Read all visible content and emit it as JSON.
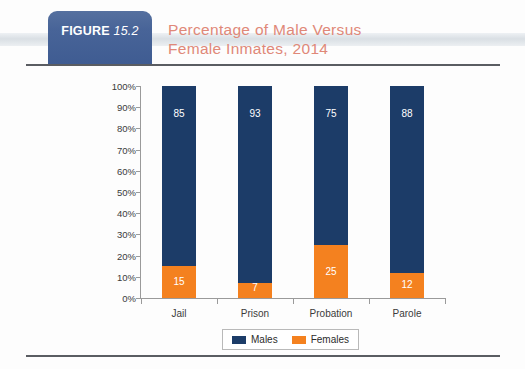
{
  "figure": {
    "badge_word": "FIGURE",
    "badge_number": "15.2",
    "title_line1": "Percentage of Male Versus",
    "title_line2": "Female Inmates, 2014",
    "title_color": "#e08878",
    "badge_color": "#486498"
  },
  "chart_data": {
    "type": "bar",
    "stacked": true,
    "title": "Percentage of Male Versus Female Inmates, 2014",
    "xlabel": "",
    "ylabel": "",
    "ylim": [
      0,
      100
    ],
    "ytick_labels": [
      "100%",
      "90%",
      "80%",
      "70%",
      "60%",
      "50%",
      "40%",
      "30%",
      "20%",
      "10%",
      "0%"
    ],
    "ytick_values": [
      100,
      90,
      80,
      70,
      60,
      50,
      40,
      30,
      20,
      10,
      0
    ],
    "grid": false,
    "legend_position": "bottom",
    "categories": [
      "Jail",
      "Prison",
      "Probation",
      "Parole"
    ],
    "series": [
      {
        "name": "Males",
        "color": "#1c3c68",
        "values": [
          85,
          93,
          75,
          88
        ]
      },
      {
        "name": "Females",
        "color": "#f4811f",
        "values": [
          15,
          7,
          25,
          12
        ]
      }
    ]
  },
  "legend": {
    "items": [
      {
        "label": "Males",
        "color": "#1c3c68"
      },
      {
        "label": "Females",
        "color": "#f4811f"
      }
    ]
  }
}
